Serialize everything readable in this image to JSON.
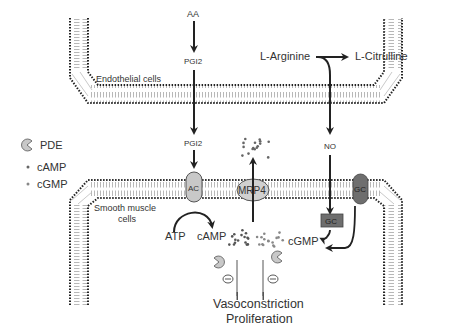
{
  "diagram": {
    "title": "",
    "legend": {
      "pde": "PDE",
      "camp": "cAMP",
      "cgmp": "cGMP"
    },
    "compartments": {
      "endothelial": "Endothelial cells",
      "smooth_muscle_line1": "Smooth muscle",
      "smooth_muscle_line2": "cells"
    },
    "molecules": {
      "aa": "AA",
      "pgi2_top": "PGI2",
      "pgi2_bottom": "PGI2",
      "l_arginine": "L-Arginine",
      "l_citrulline": "L-Citrulline",
      "no": "NO",
      "atp": "ATP",
      "camp": "cAMP",
      "cgmp": "cGMP"
    },
    "proteins": {
      "ac": "AC",
      "mrp4": "MRP4",
      "gc_membrane": "GC",
      "gc_soluble": "GC"
    },
    "outcome": {
      "line1": "Vasoconstriction",
      "line2": "Proliferation"
    },
    "inhibition_symbol": "⊖",
    "colors": {
      "text": "#333333",
      "arrow": "#222222",
      "membrane_dot": "#222222",
      "membrane_tail": "#888888",
      "protein_light": "#c8c8c8",
      "protein_dark": "#6e6e6e",
      "pde": "#c8c8c8",
      "molecule_dot": "#555555"
    }
  }
}
